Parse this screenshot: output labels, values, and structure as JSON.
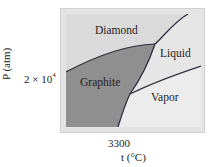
{
  "diagram": {
    "type": "phase-diagram",
    "substance": "carbon",
    "regions": [
      {
        "name": "diamond",
        "label": "Diamond",
        "color": "#dadada"
      },
      {
        "name": "liquid",
        "label": "Liquid",
        "color": "#e6e6e6"
      },
      {
        "name": "graphite",
        "label": "Graphite",
        "color": "#8f8f8f"
      },
      {
        "name": "vapor",
        "label": "Vapor",
        "color": "#ececec"
      }
    ],
    "axes": {
      "y_label": "P (atm)",
      "y_tick": "2 × 10",
      "y_tick_exp": "4",
      "x_label": "t (°C)",
      "x_tick": "3300"
    },
    "colors": {
      "frame": "#e4e4e4",
      "boundary": "#2a2a3a"
    }
  }
}
